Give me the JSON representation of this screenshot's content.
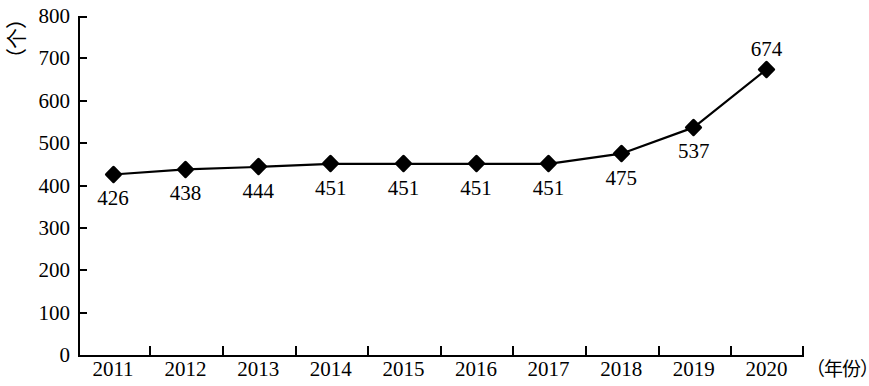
{
  "chart_data": {
    "type": "line",
    "title": "",
    "subtitle": "",
    "xlabel": "（年份）",
    "ylabel": "（个）",
    "categories": [
      "2011",
      "2012",
      "2013",
      "2014",
      "2015",
      "2016",
      "2017",
      "2018",
      "2019",
      "2020"
    ],
    "values": [
      426,
      438,
      444,
      451,
      451,
      451,
      451,
      475,
      537,
      674
    ],
    "series": [
      {
        "name": "",
        "values": [
          426,
          438,
          444,
          451,
          451,
          451,
          451,
          475,
          537,
          674
        ]
      }
    ],
    "point_labels": [
      "426",
      "438",
      "444",
      "451",
      "451",
      "451",
      "451",
      "475",
      "537",
      "674"
    ],
    "point_label_positions": [
      "below",
      "below",
      "below",
      "below",
      "below",
      "below",
      "below",
      "below",
      "below",
      "above"
    ],
    "ylim": [
      0,
      800
    ],
    "ytick_labels": [
      "800",
      "700",
      "600",
      "500",
      "400",
      "300",
      "200",
      "100",
      "0"
    ],
    "ytick_values": [
      800,
      700,
      600,
      500,
      400,
      300,
      200,
      100,
      0
    ],
    "grid": false,
    "legend": false,
    "legend_position": "none",
    "marker": "diamond",
    "line_color": "#000000",
    "marker_color": "#000000",
    "background_color": "#ffffff"
  }
}
